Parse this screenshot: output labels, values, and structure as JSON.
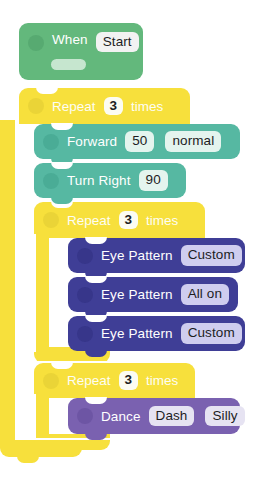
{
  "app": {
    "type": "block-programming-canvas",
    "background": "#ffffff",
    "width": 261,
    "height": 485
  },
  "palette": {
    "event_green": "#63b87c",
    "control_yellow": "#f7e03c",
    "drive_teal": "#56b8a2",
    "light_navy": "#3f3e96",
    "animation_purple": "#7a61b0",
    "field_number": "#fcfcf2",
    "field_teal": "#e4f4ee",
    "field_lavender": "#cfcdef"
  },
  "program": {
    "title": "Block Program",
    "blocks": [
      {
        "id": "when-start",
        "name": "when-start-block",
        "category": "event",
        "color": "#63b87c",
        "label": "When",
        "fields": [
          {
            "name": "event",
            "value": "Start",
            "style": "white"
          }
        ]
      },
      {
        "id": "repeat-outer",
        "name": "repeat-block-outer",
        "category": "control",
        "color": "#f7e03c",
        "label_before": "Repeat",
        "label_after": "times",
        "fields": [
          {
            "name": "count",
            "value": "3",
            "style": "number"
          }
        ]
      },
      {
        "id": "forward",
        "name": "forward-block",
        "category": "drive",
        "color": "#56b8a2",
        "label": "Forward",
        "fields": [
          {
            "name": "distance",
            "value": "50",
            "style": "number"
          },
          {
            "name": "speed",
            "value": "normal",
            "style": "light"
          }
        ]
      },
      {
        "id": "turn-right",
        "name": "turn-right-block",
        "category": "drive",
        "color": "#56b8a2",
        "label": "Turn Right",
        "fields": [
          {
            "name": "angle",
            "value": "90",
            "style": "light"
          }
        ]
      },
      {
        "id": "repeat-inner-1",
        "name": "repeat-block-inner-1",
        "category": "control",
        "color": "#f7e03c",
        "label_before": "Repeat",
        "label_after": "times",
        "fields": [
          {
            "name": "count",
            "value": "3",
            "style": "number"
          }
        ]
      },
      {
        "id": "eye-pattern-1",
        "name": "eye-pattern-block-1",
        "category": "light",
        "color": "#3f3e96",
        "label": "Eye Pattern",
        "fields": [
          {
            "name": "pattern",
            "value": "Custom",
            "style": "lavender"
          }
        ]
      },
      {
        "id": "eye-pattern-2",
        "name": "eye-pattern-block-2",
        "category": "light",
        "color": "#3f3e96",
        "label": "Eye Pattern",
        "fields": [
          {
            "name": "pattern",
            "value": "All on",
            "style": "lavender"
          }
        ]
      },
      {
        "id": "eye-pattern-3",
        "name": "eye-pattern-block-3",
        "category": "light",
        "color": "#3f3e96",
        "label": "Eye Pattern",
        "fields": [
          {
            "name": "pattern",
            "value": "Custom",
            "style": "lavender"
          }
        ]
      },
      {
        "id": "repeat-inner-2",
        "name": "repeat-block-inner-2",
        "category": "control",
        "color": "#f7e03c",
        "label_before": "Repeat",
        "label_after": "times",
        "fields": [
          {
            "name": "count",
            "value": "3",
            "style": "number"
          }
        ]
      },
      {
        "id": "dance",
        "name": "dance-block",
        "category": "animation",
        "color": "#7a61b0",
        "label": "Dance",
        "fields": [
          {
            "name": "robot",
            "value": "Dash",
            "style": "lavender-light"
          },
          {
            "name": "move",
            "value": "Silly",
            "style": "lavender-light"
          }
        ]
      }
    ]
  },
  "text": {
    "when": "When",
    "start": "Start",
    "repeat": "Repeat",
    "times": "times",
    "count_3": "3",
    "forward": "Forward",
    "fifty": "50",
    "normal": "normal",
    "turn_right": "Turn Right",
    "ninety": "90",
    "eye_pattern": "Eye Pattern",
    "custom": "Custom",
    "all_on": "All on",
    "dance": "Dance",
    "dash": "Dash",
    "silly": "Silly"
  }
}
